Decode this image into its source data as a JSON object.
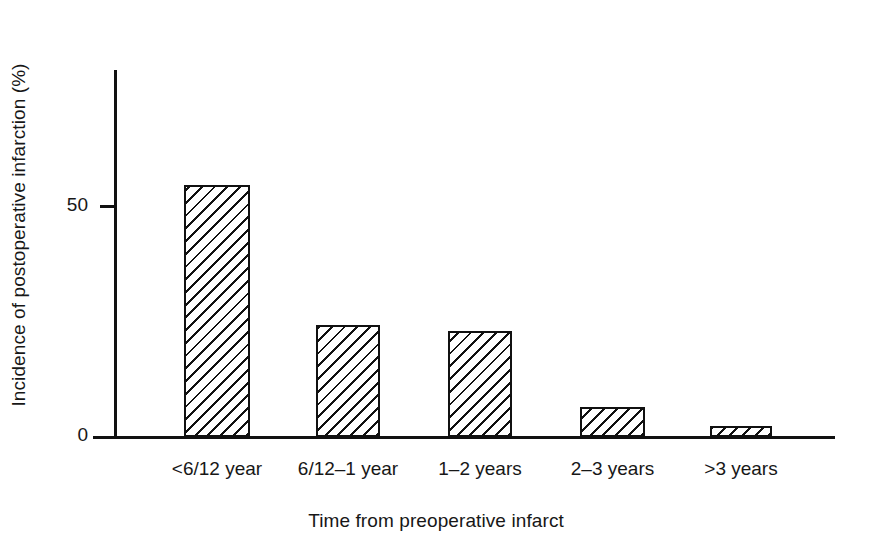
{
  "chart_data": {
    "type": "bar",
    "title": "",
    "subtitle": "",
    "xlabel": "Time from preoperative infarct",
    "ylabel": "Incidence of postoperative infarction (%)",
    "categories": [
      "<6/12 year",
      "6/12–1 year",
      "1–2 years",
      "2–3 years",
      ">3 years"
    ],
    "values": [
      54,
      24,
      23,
      6.5,
      2
    ],
    "ylim": [
      0,
      79
    ],
    "yticks": [
      0,
      50
    ],
    "ytick_labels": [
      "0",
      "50"
    ],
    "grid": false,
    "legend": null,
    "bar_fill": "diagonal-hatch",
    "bar_color": "#111111",
    "background": "#ffffff"
  },
  "axes": {
    "y_title": "Incidence of postoperative infarction (%)",
    "x_title": "Time from preoperative infarct",
    "y_tick_0": "0",
    "y_tick_50": "50"
  },
  "bars": [
    {
      "label": "<6/12 year",
      "value": 54,
      "left_px": 70,
      "width_px": 66,
      "height_px": 252
    },
    {
      "label": "6/12–1 year",
      "value": 24,
      "left_px": 202,
      "width_px": 64,
      "height_px": 112
    },
    {
      "label": "1–2 years",
      "value": 23,
      "left_px": 334,
      "width_px": 64,
      "height_px": 106
    },
    {
      "label": "2–3 years",
      "value": 6.5,
      "left_px": 466,
      "width_px": 65,
      "height_px": 30
    },
    {
      "label": ">3 years",
      "value": 2,
      "left_px": 596,
      "width_px": 62,
      "height_px": 11
    }
  ]
}
